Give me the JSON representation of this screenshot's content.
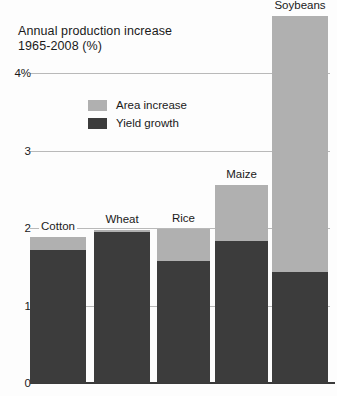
{
  "chart_data": {
    "type": "bar",
    "title": "Annual production increase\n1965-2008 (%)",
    "subtitle": "",
    "xlabel": "",
    "ylabel": "",
    "stacked": true,
    "grid": true,
    "legend_position": "inside-top-left",
    "ylim": [
      0,
      4.9
    ],
    "yticks": [
      "0",
      "1",
      "2",
      "3",
      "4%"
    ],
    "ytick_values": [
      0,
      1,
      2,
      3,
      4
    ],
    "categories": [
      "Cotton",
      "Wheat",
      "Rice",
      "Maize",
      "Soybeans"
    ],
    "series": [
      {
        "name": "Yield growth",
        "color": "#3c3c3c",
        "values": [
          1.72,
          1.95,
          1.57,
          1.83,
          1.43
        ]
      },
      {
        "name": "Area increase",
        "color": "#b0b0b0",
        "values": [
          0.16,
          0.02,
          0.42,
          0.73,
          3.31
        ]
      }
    ],
    "totals": [
      1.88,
      1.97,
      1.99,
      2.56,
      4.74
    ]
  },
  "legend": {
    "items": [
      {
        "label": "Area increase",
        "color": "#b0b0b0"
      },
      {
        "label": "Yield growth",
        "color": "#3c3c3c"
      }
    ]
  }
}
